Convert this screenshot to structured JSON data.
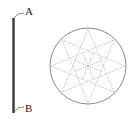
{
  "diagram": {
    "rod": {
      "top_label": "A",
      "bottom_label": "B",
      "color": "#333333"
    },
    "disc": {
      "shape": "circle with inscribed 8-pointed star {8/3} and radial lines",
      "outline_color": "#8a8a8a",
      "star_points": 8,
      "line_style": "dotted"
    }
  }
}
